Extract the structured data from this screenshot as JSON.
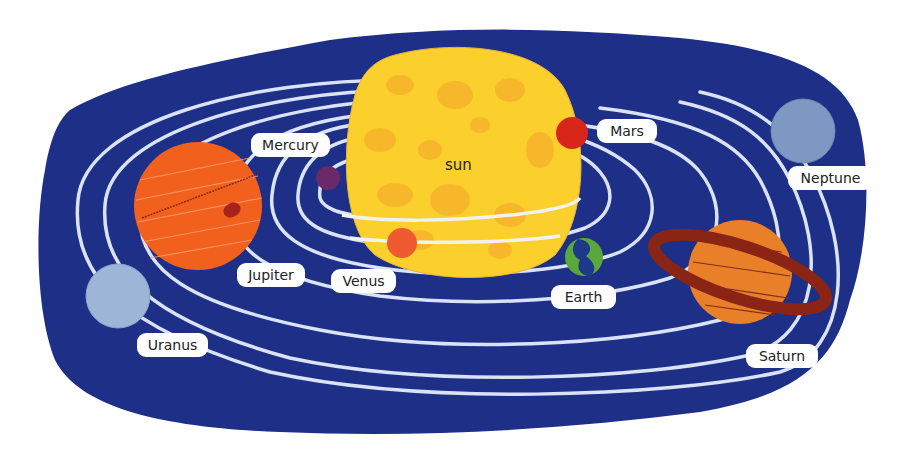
{
  "diagram": {
    "type": "solar-system-illustration",
    "colors": {
      "space": "#1d2f86",
      "orbit": "#d9e2f6",
      "sun": "#fbcf2c",
      "sun_spots": "#f5b12a",
      "label_bg": "#ffffff",
      "label_text": "#222222"
    },
    "sun": {
      "label": "sun"
    },
    "planets": [
      {
        "name": "Mercury",
        "label": "Mercury",
        "color": "#6a2a6a"
      },
      {
        "name": "Venus",
        "label": "Venus",
        "color": "#f05a30"
      },
      {
        "name": "Earth",
        "label": "Earth",
        "color": "#1d3a8a",
        "land_color": "#5aa83a"
      },
      {
        "name": "Mars",
        "label": "Mars",
        "color": "#d8261a"
      },
      {
        "name": "Jupiter",
        "label": "Jupiter",
        "color": "#f2601e",
        "spot_color": "#a8241a"
      },
      {
        "name": "Saturn",
        "label": "Saturn",
        "color": "#ea7f2a",
        "ring_color": "#8a2414"
      },
      {
        "name": "Uranus",
        "label": "Uranus",
        "color": "#9db6d8"
      },
      {
        "name": "Neptune",
        "label": "Neptune",
        "color": "#7e98c4"
      }
    ]
  }
}
